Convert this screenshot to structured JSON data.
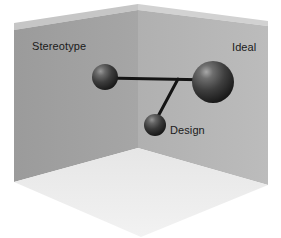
{
  "figure": {
    "width": 281,
    "height": 238,
    "background_color": "#ffffff"
  },
  "room": {
    "left_wall": {
      "name": "left-wall",
      "color": "#a0a0a0",
      "points": "14,30 138,10 138,148 14,182"
    },
    "right_wall": {
      "name": "right-wall",
      "color": "#b4b4b4",
      "points": "138,10 268,26 268,185 138,148"
    },
    "floor": {
      "name": "floor",
      "color": "#ececec",
      "points": "14,182 138,148 268,185 141,237"
    },
    "left_bevel": {
      "name": "left-wall-top-bevel",
      "color": "#c6c6c6",
      "points": "14,23 138,4 138,10 14,30"
    },
    "right_bevel": {
      "name": "right-wall-top-bevel",
      "color": "#d2d2d2",
      "points": "138,4 268,21 268,26 138,10"
    }
  },
  "nodes": [
    {
      "id": "stereotype",
      "label": "Stereotype",
      "cx": 105,
      "cy": 77,
      "r": 13,
      "color": "#3a3a3a",
      "highlight_color": "#8f8f8f",
      "label_x": 32,
      "label_y": 50,
      "label_anchor": "start"
    },
    {
      "id": "ideal",
      "label": "Ideal",
      "cx": 213,
      "cy": 82,
      "r": 21,
      "color": "#3a3a3a",
      "highlight_color": "#9a9a9a",
      "label_x": 232,
      "label_y": 51,
      "label_anchor": "start"
    },
    {
      "id": "design",
      "label": "Design",
      "cx": 155,
      "cy": 125,
      "r": 11,
      "color": "#3a3a3a",
      "highlight_color": "#8a8a8a",
      "label_x": 170,
      "label_y": 134,
      "label_anchor": "start"
    }
  ],
  "edges": [
    {
      "id": "stereotype-ideal",
      "from": "stereotype",
      "to": "ideal",
      "x1": 105,
      "y1": 78,
      "x2": 213,
      "y2": 80,
      "color": "#141414",
      "width": 3
    },
    {
      "id": "junction-design",
      "from": "junction",
      "to": "design",
      "x1": 178,
      "y1": 79,
      "x2": 155,
      "y2": 122,
      "color": "#141414",
      "width": 3
    }
  ],
  "colors": {
    "node_dark": "#3a3a3a",
    "edge": "#141414",
    "label_text": "#1a1a1a",
    "wall_left": "#a0a0a0",
    "wall_right": "#b4b4b4",
    "floor": "#ececec"
  }
}
